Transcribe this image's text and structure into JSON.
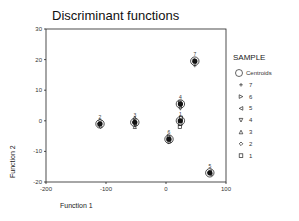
{
  "chart_data": {
    "type": "scatter",
    "title": "Discriminant functions",
    "xlabel": "Function 1",
    "ylabel": "Function 2",
    "xlim": [
      -200,
      100
    ],
    "ylim": [
      -20,
      30
    ],
    "x_ticks": [
      "-200",
      "-100",
      "0",
      "100"
    ],
    "x_tick_values": [
      -200,
      -100,
      0,
      100
    ],
    "y_ticks": [
      "30",
      "20",
      "10",
      "0",
      "-10",
      "-20"
    ],
    "y_tick_values": [
      30,
      20,
      10,
      0,
      -10,
      -20
    ],
    "grid": false,
    "legend": {
      "title": "SAMPLE",
      "placement": "right",
      "entries": [
        {
          "label": "Centroids",
          "marker": "circle"
        },
        {
          "label": "7",
          "marker": "plus"
        },
        {
          "label": "6",
          "marker": "triangle-right"
        },
        {
          "label": "5",
          "marker": "triangle-left"
        },
        {
          "label": "4",
          "marker": "triangle-down"
        },
        {
          "label": "3",
          "marker": "triangle-up"
        },
        {
          "label": "2",
          "marker": "diamond"
        },
        {
          "label": "1",
          "marker": "square"
        }
      ]
    },
    "series": [
      {
        "name": "2",
        "centroid": [
          -110,
          -1
        ],
        "points": [
          [
            -112,
            -1
          ],
          [
            -109,
            -2
          ],
          [
            -110,
            0
          ],
          [
            -111,
            -1.5
          ]
        ]
      },
      {
        "name": "3",
        "centroid": [
          -52,
          -0.5
        ],
        "points": [
          [
            -53,
            0
          ],
          [
            -51,
            -1
          ],
          [
            -52,
            -2
          ],
          [
            -52,
            1
          ]
        ]
      },
      {
        "name": "6",
        "centroid": [
          5,
          -6
        ],
        "points": [
          [
            4,
            -6
          ],
          [
            6,
            -7
          ],
          [
            5,
            -5
          ]
        ]
      },
      {
        "name": "4",
        "centroid": [
          24,
          5.5
        ],
        "points": [
          [
            23,
            6
          ],
          [
            25,
            5
          ],
          [
            24,
            4
          ]
        ]
      },
      {
        "name": "1",
        "centroid": [
          24,
          0
        ],
        "points": [
          [
            23,
            0
          ],
          [
            25,
            1
          ],
          [
            24,
            -1
          ],
          [
            23,
            -2
          ]
        ]
      },
      {
        "name": "7",
        "centroid": [
          48,
          19.5
        ],
        "points": [
          [
            47,
            20
          ],
          [
            49,
            19
          ],
          [
            48,
            18
          ]
        ]
      },
      {
        "name": "5",
        "centroid": [
          73,
          -17
        ],
        "points": [
          [
            72,
            -17
          ],
          [
            74,
            -17.5
          ],
          [
            73,
            -16.5
          ]
        ]
      }
    ]
  }
}
